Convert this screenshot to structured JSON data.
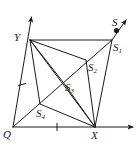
{
  "figure": {
    "title": "",
    "labels": {
      "Q": "Q",
      "X": "X",
      "Y": "Y",
      "S": "S",
      "S1_base": "S",
      "S1_sub": "1",
      "S2_base": "S",
      "S2_sub": "2",
      "S3_base": "S",
      "S3_sub": "3",
      "S4_base": "S",
      "S4_sub": "4"
    },
    "colors": {
      "stroke": "#1a1a1a",
      "background": "#ffffff",
      "label": "#1a1a1a"
    },
    "points": {
      "Q": [
        13,
        127
      ],
      "X": [
        95,
        127
      ],
      "Y": [
        30,
        40
      ],
      "S1": [
        112,
        40
      ],
      "S_dot": [
        117,
        31
      ],
      "S2": [
        86,
        60
      ],
      "S3": [
        63,
        82
      ],
      "S4": [
        40,
        104
      ]
    },
    "axes": {
      "x_axis_arrow_end": [
        136,
        127
      ],
      "y_axis_arrow_end": [
        31,
        14
      ],
      "x_tick_at": [
        57,
        127
      ],
      "y_tick_at": [
        22,
        84
      ]
    },
    "ray": {
      "from": [
        95,
        127
      ],
      "through": [
        117,
        31
      ],
      "arrow_end": [
        128,
        18
      ]
    },
    "segments": [
      [
        "Q",
        "X"
      ],
      [
        "Q",
        "Y"
      ],
      [
        "Y",
        "S1"
      ],
      [
        "S1",
        "X"
      ],
      [
        "Q",
        "S1"
      ],
      [
        "Y",
        "X"
      ],
      [
        "Y",
        "S2"
      ],
      [
        "Y",
        "S3"
      ],
      [
        "Y",
        "S4"
      ],
      [
        "S2",
        "X"
      ],
      [
        "S3",
        "X"
      ],
      [
        "S4",
        "X"
      ]
    ]
  }
}
